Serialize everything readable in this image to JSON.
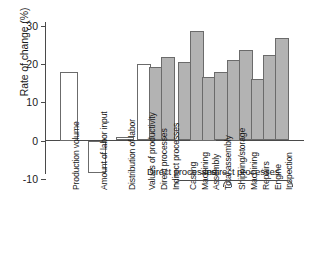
{
  "chart_data": {
    "type": "bar",
    "title": "",
    "xlabel": "",
    "ylabel": "Rate of change (%)",
    "ylim": [
      -10,
      33
    ],
    "yticks": [
      30,
      20,
      10,
      0,
      -10
    ],
    "ytick_labels": [
      "30",
      "20",
      "10",
      "0",
      "-10"
    ],
    "grid": false,
    "legend": null,
    "categories": [
      "Production volume",
      "Amount of labor input",
      "Distribution of labor",
      "Values of productivity",
      "Direct processes",
      "Indirect processes",
      "Casting",
      "Machining",
      "Assembly",
      "Total assembly",
      "Shipping/storage",
      "Machining",
      "Repairs",
      "Engine",
      "Inspection"
    ],
    "values": [
      18.0,
      -8.5,
      1.0,
      20.0,
      19.2,
      21.9,
      20.4,
      28.5,
      16.5,
      17.9,
      21.0,
      23.5,
      16.0,
      22.3,
      26.7
    ],
    "bar_styles": [
      "open",
      "open",
      "open",
      "open",
      "filled",
      "filled",
      "filled",
      "filled",
      "filled",
      "filled",
      "filled",
      "filled",
      "filled",
      "filled",
      "filled"
    ],
    "annotations": [
      {
        "text": "Direct processes",
        "covers": [
          "Casting",
          "Machining",
          "Assembly",
          "Total assembly"
        ]
      },
      {
        "text": "Indirect processes",
        "covers": [
          "Shipping/storage",
          "Machining",
          "Repairs",
          "Engine",
          "Inspection"
        ]
      }
    ],
    "colors": {
      "bar_fill": "#b3b3b3",
      "bar_open": "#ffffff",
      "bar_edge": "#6b6b6b",
      "axis": "#4a4a4a",
      "text": "#1a1a1a"
    }
  },
  "groups": {
    "direct": "Direct processes",
    "indirect": "Indirect processes"
  }
}
